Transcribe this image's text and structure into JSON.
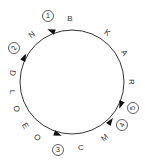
{
  "diagram": {
    "type": "circular-route",
    "circle": {
      "cx": 72,
      "cy": 82,
      "r": 52,
      "stroke": "#333333"
    },
    "letters": [
      {
        "text": "B",
        "x": 70,
        "y": 19,
        "rot": 0
      },
      {
        "text": "K",
        "x": 107,
        "y": 33,
        "rot": 35
      },
      {
        "text": "A",
        "x": 124,
        "y": 53,
        "rot": 60
      },
      {
        "text": "R",
        "x": 131,
        "y": 82,
        "rot": 90
      },
      {
        "text": "M",
        "x": 105,
        "y": 138,
        "rot": -40
      },
      {
        "text": "C",
        "x": 81,
        "y": 148,
        "rot": 0
      },
      {
        "text": "O",
        "x": 37,
        "y": 138,
        "rot": 40
      },
      {
        "text": "E",
        "x": 25,
        "y": 126,
        "rot": 60
      },
      {
        "text": "O",
        "x": 16,
        "y": 109,
        "rot": 75
      },
      {
        "text": "L",
        "x": 12,
        "y": 92,
        "rot": 90
      },
      {
        "text": "D",
        "x": 12,
        "y": 73,
        "rot": 100
      },
      {
        "text": "N",
        "x": 32,
        "y": 35,
        "rot": -40
      }
    ],
    "markers": [
      {
        "num": "1",
        "x": 48,
        "y": 16,
        "rot": 0
      },
      {
        "num": "2",
        "x": 14,
        "y": 48,
        "rot": -60
      },
      {
        "num": "3",
        "x": 58,
        "y": 150,
        "rot": 0
      },
      {
        "num": "4",
        "x": 122,
        "y": 125,
        "rot": -60
      },
      {
        "num": "5",
        "x": 133,
        "y": 108,
        "rot": -90
      }
    ],
    "arrows": [
      {
        "x": 52,
        "y": 31,
        "angle": 200
      },
      {
        "x": 24,
        "y": 58,
        "angle": 295
      },
      {
        "x": 57,
        "y": 134,
        "angle": 20
      },
      {
        "x": 110,
        "y": 122,
        "angle": 305
      },
      {
        "x": 121,
        "y": 104,
        "angle": 110
      }
    ]
  }
}
